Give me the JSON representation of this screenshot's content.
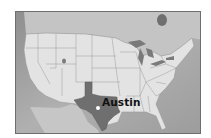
{
  "map": {
    "type": "locator-map",
    "region": "United States",
    "highlighted_state": "Texas",
    "marker": {
      "label": "Austin",
      "shape": "dot",
      "color": "#ffffff"
    },
    "colors": {
      "land": "#e4e4e4",
      "highlight": "#6f6f6f",
      "water": "#a8a8a8",
      "canada_mexico": "#c3c3c3",
      "borders": "#8a8a8a",
      "frame": "#6e6e6e"
    }
  }
}
